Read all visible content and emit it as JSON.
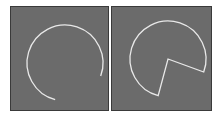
{
  "figure": {
    "panels": [
      {
        "id": "left",
        "description": "open arc (circle segment without center lines)",
        "shape": "arc",
        "center": [
          54,
          56
        ],
        "radius": 38,
        "start_angle_deg": -20,
        "end_angle_deg": 255,
        "stroke": "#e8e8e8",
        "fill": "#6b6b6b"
      },
      {
        "id": "right",
        "description": "sector (pie slice outline with radial lines to center)",
        "shape": "sector",
        "center": [
          56,
          52
        ],
        "radius": 38,
        "start_angle_deg": -20,
        "end_angle_deg": 255,
        "stroke": "#e8e8e8",
        "fill": "#6b6b6b"
      }
    ],
    "colors": {
      "background": "#ffffff",
      "panel_fill": "#6b6b6b",
      "panel_border": "#3a3a3a",
      "stroke": "#e8e8e8"
    }
  }
}
